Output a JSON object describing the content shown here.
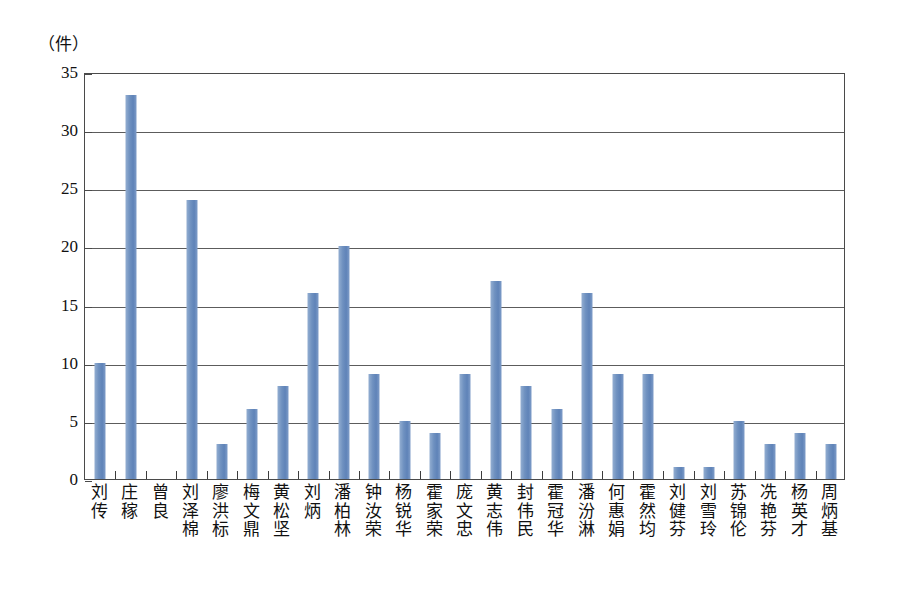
{
  "chart_data": {
    "type": "bar",
    "title": "",
    "subtitle": "",
    "xlabel": "",
    "ylabel": "",
    "unit_caption": "（件）",
    "ylim": [
      0,
      35
    ],
    "ytick_step": 5,
    "yticks": [
      0,
      5,
      10,
      15,
      20,
      25,
      30,
      35
    ],
    "grid": true,
    "grid_axis": "y",
    "legend": false,
    "legend_position": "none",
    "bar_color": "#6f91c0",
    "frame_color": "#4a4a4a",
    "gridline_color": "#5c5c5c",
    "categories": [
      "刘传",
      "庄稼",
      "曾良",
      "刘泽棉",
      "廖洪标",
      "梅文鼎",
      "黄松坚",
      "刘炳",
      "潘柏林",
      "钟汝荣",
      "杨锐华",
      "霍家荣",
      "庞文忠",
      "黄志伟",
      "封伟民",
      "霍冠华",
      "潘汾淋",
      "何惠娟",
      "霍然均",
      "刘健芬",
      "刘雪玲",
      "苏锦伦",
      "冼艳芬",
      "杨英才",
      "周炳基"
    ],
    "values": [
      10,
      33,
      0,
      24,
      3,
      6,
      8,
      16,
      20,
      9,
      5,
      4,
      9,
      17,
      8,
      6,
      16,
      9,
      9,
      1,
      1,
      5,
      3,
      4,
      3
    ]
  }
}
